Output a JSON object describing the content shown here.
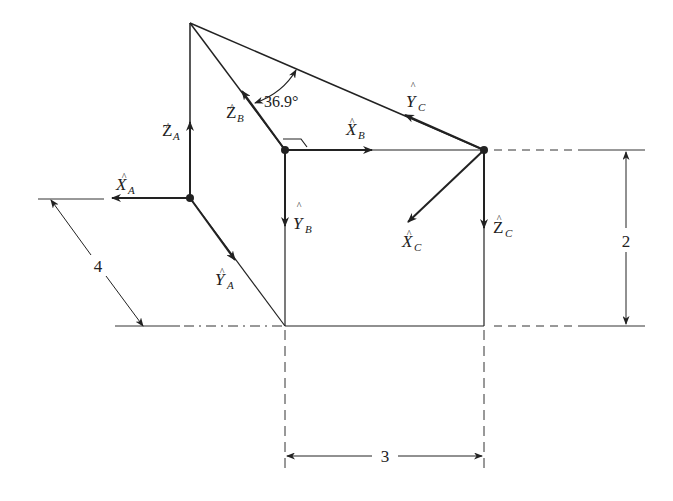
{
  "figure": {
    "angle_label": "36.9°",
    "dimensions": {
      "vertical": "2",
      "horizontal": "3",
      "diagonal": "4"
    },
    "frames": {
      "A": {
        "x": {
          "base": "X",
          "sub": "A",
          "hat": "^"
        },
        "y": {
          "base": "Y",
          "sub": "A",
          "hat": "^"
        },
        "z": {
          "base": "Z",
          "sub": "A",
          "hat": "^"
        }
      },
      "B": {
        "x": {
          "base": "X",
          "sub": "B",
          "hat": "^"
        },
        "y": {
          "base": "Y",
          "sub": "B",
          "hat": "^"
        },
        "z": {
          "base": "Z",
          "sub": "B",
          "hat": "^"
        }
      },
      "C": {
        "x": {
          "base": "X",
          "sub": "C",
          "hat": "^"
        },
        "y": {
          "base": "Y",
          "sub": "C",
          "hat": "^"
        },
        "z": {
          "base": "Z",
          "sub": "C",
          "hat": "^"
        }
      }
    },
    "colors": {
      "line": "#222222",
      "background": "#ffffff"
    }
  }
}
